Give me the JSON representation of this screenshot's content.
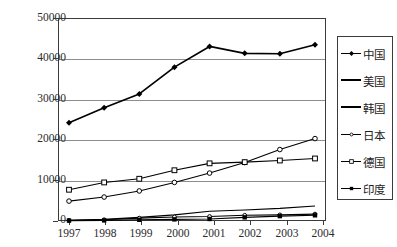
{
  "chart_data": {
    "type": "line",
    "title": "",
    "xlabel": "",
    "ylabel": "",
    "categories": [
      "1997",
      "1998",
      "1999",
      "2000",
      "2001",
      "2002",
      "2003",
      "2004"
    ],
    "x": [
      1997,
      1998,
      1999,
      2000,
      2001,
      2002,
      2003,
      2004
    ],
    "ylim": [
      0,
      50000
    ],
    "yticks": [
      "0",
      "10000",
      "20000",
      "30000",
      "40000",
      "50000"
    ],
    "ytick_values": [
      0,
      10000,
      20000,
      30000,
      40000,
      50000
    ],
    "grid": true,
    "legend_position": "right",
    "series": [
      {
        "name": "中国",
        "marker": "filled-diamond",
        "color": "#000000",
        "values": [
          24200,
          27900,
          31300,
          37900,
          43000,
          41300,
          41200,
          43400
        ]
      },
      {
        "name": "美国",
        "marker": "open-circle",
        "color": "#000000",
        "values": [
          4900,
          5900,
          7400,
          9500,
          11800,
          14400,
          17600,
          20300
        ]
      },
      {
        "name": "韩国",
        "marker": "none",
        "color": "#000000",
        "values": [
          200,
          400,
          900,
          1500,
          2400,
          2700,
          3100,
          3700
        ]
      },
      {
        "name": "日本",
        "marker": "small-cross",
        "color": "#000000",
        "values": [
          150,
          300,
          700,
          1000,
          1100,
          1400,
          1500,
          1700
        ]
      },
      {
        "name": "德国",
        "marker": "open-square",
        "color": "#000000",
        "values": [
          7700,
          9500,
          10400,
          12500,
          14200,
          14500,
          14900,
          15400
        ]
      },
      {
        "name": "印度",
        "marker": "filled-square",
        "color": "#000000",
        "values": [
          100,
          150,
          300,
          400,
          500,
          900,
          1200,
          1400
        ]
      }
    ]
  },
  "legend": {
    "items": [
      {
        "label": "中国",
        "marker": "filled-diamond"
      },
      {
        "label": "美国",
        "marker": "line-only"
      },
      {
        "label": "韩国",
        "marker": "line-only"
      },
      {
        "label": "日本",
        "marker": "small-cross"
      },
      {
        "label": "德国",
        "marker": "open-square"
      },
      {
        "label": "印度",
        "marker": "filled-square"
      }
    ]
  },
  "axes": {
    "y_labels": [
      "50000",
      "40000",
      "30000",
      "20000",
      "10000",
      "0"
    ],
    "x_labels": [
      "1997",
      "1998",
      "1999",
      "2000",
      "2001",
      "2002",
      "2003",
      "2004"
    ]
  },
  "colors": {
    "line": "#000000",
    "grid": "#8d8d8d",
    "frame": "#3b3b3b",
    "text": "#2b2b2b",
    "background": "#ffffff"
  }
}
